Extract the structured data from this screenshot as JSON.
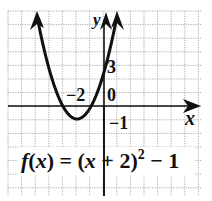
{
  "chart_data": {
    "type": "line",
    "function": "f(x) = (x + 2)^2 - 1",
    "xlabel": "x",
    "ylabel": "y",
    "grid": true,
    "xlim": [
      -7,
      7
    ],
    "ylim": [
      -6.5,
      7
    ],
    "vertex": {
      "x": -2,
      "y": -1
    },
    "y_intercept": {
      "x": 0,
      "y": 3
    },
    "annotations": [
      "-2",
      "3",
      "0",
      "-1"
    ],
    "series": [
      {
        "name": "f(x) = (x + 2)^2 - 1",
        "x": [
          -5,
          -4,
          -3,
          -2,
          -1,
          0,
          1
        ],
        "y": [
          8,
          3,
          0,
          -1,
          0,
          3,
          8
        ]
      }
    ],
    "colors": {
      "curve": "#111111",
      "grid": "#9a9a9a",
      "axes": "#111111"
    }
  },
  "labels": {
    "y_axis": "y",
    "x_axis": "x",
    "vertex_x": "−2",
    "y_three": "3",
    "y_zero": "0",
    "y_neg_one": "−1",
    "formula_f": "f",
    "formula_open": "(",
    "formula_x1": "x",
    "formula_mid": ") = (",
    "formula_x2": "x",
    "formula_plus": " + 2)",
    "formula_exp": "2",
    "formula_tail": " − 1"
  }
}
